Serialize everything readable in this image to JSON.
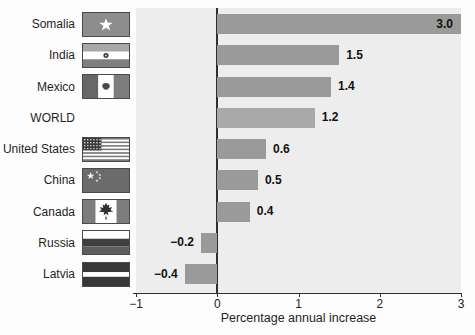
{
  "chart_data": {
    "type": "bar",
    "orientation": "horizontal",
    "xlabel": "Percentage annual increase",
    "xlim": [
      -1,
      3
    ],
    "grid": false,
    "legend": null,
    "x_ticks": [
      {
        "value": -1,
        "label": "−1"
      },
      {
        "value": 0,
        "label": "0"
      },
      {
        "value": 1,
        "label": "1"
      },
      {
        "value": 2,
        "label": "2"
      },
      {
        "value": 3,
        "label": "3"
      }
    ],
    "categories": [
      "Somalia",
      "India",
      "Mexico",
      "WORLD",
      "United States",
      "China",
      "Canada",
      "Russia",
      "Latvia"
    ],
    "values": [
      3.0,
      1.5,
      1.4,
      1.2,
      0.6,
      0.5,
      0.4,
      -0.2,
      -0.4
    ],
    "value_labels": [
      "3.0",
      "1.5",
      "1.4",
      "1.2",
      "0.6",
      "0.5",
      "0.4",
      "−0.2",
      "−0.4"
    ],
    "flags": [
      "somalia",
      "india",
      "mexico",
      null,
      "united-states",
      "china",
      "canada",
      "russia",
      "latvia"
    ],
    "colors": {
      "bar": "#9a9a9a",
      "bar_world": "#a9a9a9",
      "plot_background": "#ededed",
      "axis_line": "#2f2f2f",
      "value_label_text": "#111111",
      "category_label_text": "#1f1f1f"
    }
  }
}
